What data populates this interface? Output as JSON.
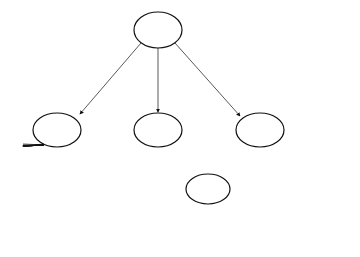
{
  "levels": {
    "header": "level",
    "values": [
      "I",
      "2",
      "3",
      "4"
    ]
  },
  "nodes": {
    "a": {
      "label": "a",
      "keys": [
        "20",
        "40"
      ]
    },
    "b": {
      "label": "b",
      "keys": [
        "10",
        "15"
      ]
    },
    "c": {
      "label": "c",
      "keys": [
        "25",
        "30"
      ]
    },
    "d": {
      "label": "d",
      "keys": [
        "45",
        "50"
      ]
    },
    "e": {
      "label": "e",
      "keys": [
        "35"
      ]
    }
  },
  "leaf_label": "F"
}
